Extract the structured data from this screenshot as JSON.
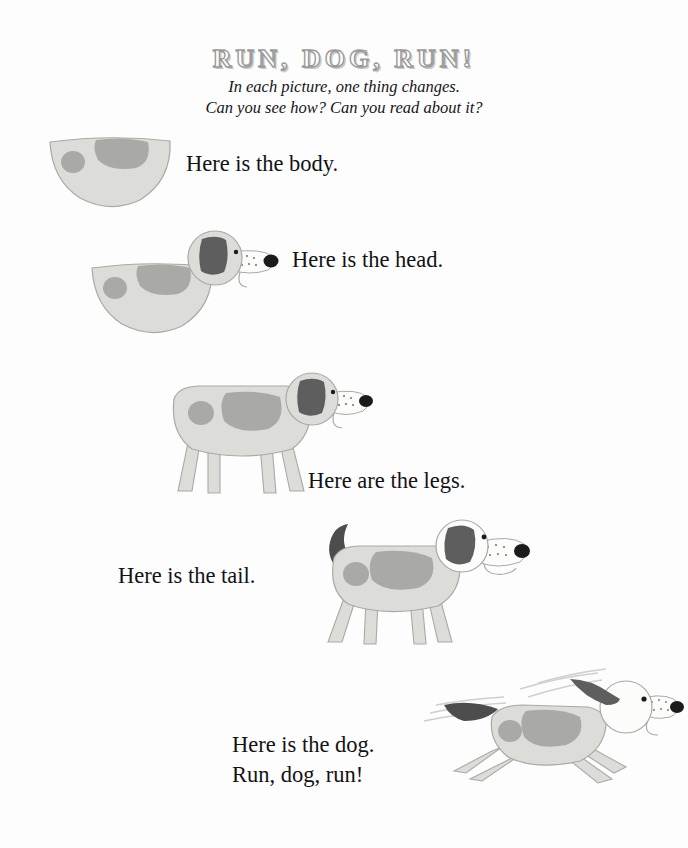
{
  "page": {
    "title": "RUN, DOG, RUN!",
    "subtitle_line1": "In each picture, one thing changes.",
    "subtitle_line2": "Can you see how? Can you read about it?",
    "background_color": "#fdfdfd",
    "text_color": "#121216",
    "title_color": "#c9c9c9"
  },
  "palette": {
    "body_fill": "#dcdcd8",
    "body_outline": "#a9a9a5",
    "spot_fill": "#a9a9a6",
    "ear_dark": "#5e5e5e",
    "tail_dark": "#4d4d4d",
    "muzzle_fill": "#fcfcfa",
    "nose_black": "#1b1b1b",
    "eye_black": "#1b1b1b",
    "freckle": "#7a7a7a",
    "motion_streak": "#c8c8c6"
  },
  "steps": [
    {
      "id": "body",
      "caption": "Here is the body.",
      "figure_name": "dog-body-only",
      "caption_name": "caption-body"
    },
    {
      "id": "head",
      "caption": "Here is the head.",
      "figure_name": "dog-body-head",
      "caption_name": "caption-head"
    },
    {
      "id": "legs",
      "caption": "Here are the legs.",
      "figure_name": "dog-body-head-legs",
      "caption_name": "caption-legs"
    },
    {
      "id": "tail",
      "caption": "Here is the tail.",
      "figure_name": "dog-body-head-legs-tail",
      "caption_name": "caption-tail"
    },
    {
      "id": "dog",
      "caption_line1": "Here is the dog.",
      "caption_line2": "Run, dog, run!",
      "figure_name": "dog-running",
      "caption_name": "caption-dog"
    }
  ]
}
